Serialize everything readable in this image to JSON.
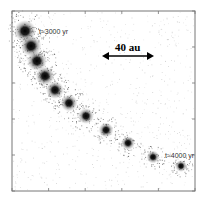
{
  "figure": {
    "type": "simulated-image-sequence",
    "start_label": "t≈3000 yr",
    "end_label": "t≈4000 yr",
    "scale_bar_label": "40 au",
    "blob_count": 11,
    "colors": {
      "blob": "#111111",
      "frame": "#777777",
      "noise": "#9a9a9a",
      "background": "#ffffff"
    }
  }
}
